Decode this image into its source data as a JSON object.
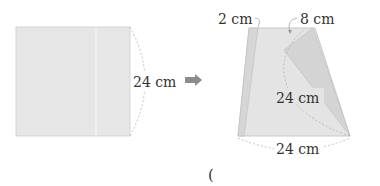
{
  "figure": {
    "left_square": {
      "side_label": "24 cm",
      "fill": "#e6e6e6",
      "edge": "#cccccc"
    },
    "arrow": {
      "icon": "right-arrow-icon",
      "color": "#8c8c8c"
    },
    "right_shape": {
      "top_left_label": "2 cm",
      "top_right_label": "8 cm",
      "diagonal_label": "24 cm",
      "bottom_label": "24 cm",
      "fill": "#e4e4e4",
      "fold_fill": "#d4d4d4",
      "strip_fill": "#d6d6d6",
      "edge": "#bdbdbd"
    },
    "answer_paren": "("
  }
}
